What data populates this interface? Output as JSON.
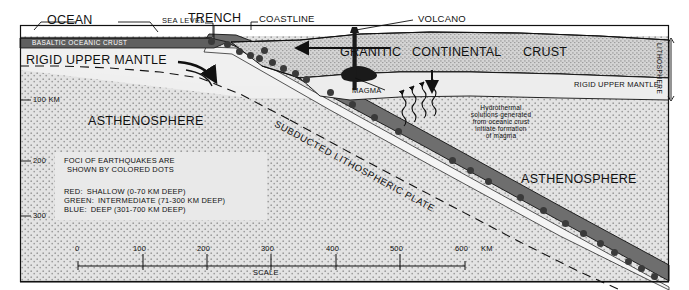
{
  "diagram": {
    "top_labels": [
      {
        "key": "ocean",
        "text": "OCEAN"
      },
      {
        "key": "sea_level",
        "text": "SEA LEVEL"
      },
      {
        "key": "trench",
        "text": "TRENCH"
      },
      {
        "key": "coastline",
        "text": "COASTLINE"
      },
      {
        "key": "volcano",
        "text": "VOLCANO"
      }
    ],
    "layers": {
      "basaltic_crust": "BASALTIC OCEANIC CRUST",
      "rigid_upper_mantle_left": "RIGID UPPER MANTLE",
      "rigid_upper_mantle_right": "RIGID UPPER MANTLE",
      "granitic": "GRANITIC",
      "continental": "CONTINENTAL",
      "crust": "CRUST",
      "asthenosphere_left": "ASTHENOSPHERE",
      "asthenosphere_right": "ASTHENOSPHERE",
      "lithosphere_bracket": "LITHOSPHERE",
      "subducted_plate": "SUBDUCTED LITHOSPHERIC PLATE",
      "magma": "MAGMA"
    },
    "annotation": {
      "hydrothermal_lines": [
        "Hydrothermal",
        "solutions generated",
        "from oceanic crust",
        "initiate formation",
        "of magma"
      ]
    },
    "depth_axis": {
      "ticks": [
        {
          "label": "100 KM",
          "y": 100
        },
        {
          "label": "200",
          "y": 161
        },
        {
          "label": "300",
          "y": 216
        }
      ]
    },
    "scale": {
      "caption": "SCALE",
      "unit": "KM",
      "ticks": [
        "0",
        "100",
        "200",
        "300",
        "400",
        "500",
        "600"
      ]
    },
    "legend": {
      "heading_line1": "FOCI OF EARTHQUAKES ARE",
      "heading_line2": "SHOWN BY COLORED DOTS",
      "entries": [
        {
          "name": "RED:",
          "desc": "SHALLOW (0-70 KM DEEP)",
          "color": "#cc2026"
        },
        {
          "name": "GREEN:",
          "desc": "INTERMEDIATE (71-300 KM DEEP)",
          "color": "#1f8a3c"
        },
        {
          "name": "BLUE:",
          "desc": "DEEP (301-700 KM DEEP)",
          "color": "#1f3f9a"
        }
      ]
    },
    "colors": {
      "ocean_crust": "#5f5f5f",
      "slab": "#6e6e6e",
      "asthenosphere": "#dedede",
      "mantle": "#ececec",
      "continental": "#d2d2d2",
      "magma": "#1a1a1a",
      "outline": "#111111",
      "dot": "#3a3a3a"
    },
    "earthquake_dots": [
      {
        "x": 211,
        "y": 41
      },
      {
        "x": 227,
        "y": 44
      },
      {
        "x": 239,
        "y": 51
      },
      {
        "x": 250,
        "y": 55
      },
      {
        "x": 259,
        "y": 58
      },
      {
        "x": 264,
        "y": 50
      },
      {
        "x": 272,
        "y": 62
      },
      {
        "x": 283,
        "y": 68
      },
      {
        "x": 295,
        "y": 73
      },
      {
        "x": 306,
        "y": 79
      },
      {
        "x": 330,
        "y": 92
      },
      {
        "x": 352,
        "y": 104
      },
      {
        "x": 374,
        "y": 117
      },
      {
        "x": 398,
        "y": 131
      },
      {
        "x": 452,
        "y": 160
      },
      {
        "x": 470,
        "y": 170
      },
      {
        "x": 488,
        "y": 181
      },
      {
        "x": 520,
        "y": 197
      },
      {
        "x": 543,
        "y": 210
      },
      {
        "x": 565,
        "y": 223
      },
      {
        "x": 583,
        "y": 233
      },
      {
        "x": 600,
        "y": 243
      },
      {
        "x": 614,
        "y": 252
      },
      {
        "x": 628,
        "y": 261
      },
      {
        "x": 641,
        "y": 268
      },
      {
        "x": 654,
        "y": 276
      }
    ]
  }
}
